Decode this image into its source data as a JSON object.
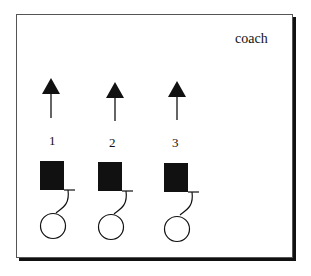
{
  "diagram": {
    "coach_label": "coach",
    "players": [
      {
        "number": "1",
        "x": 51
      },
      {
        "number": "2",
        "x": 114
      },
      {
        "number": "3",
        "x": 177
      }
    ]
  }
}
